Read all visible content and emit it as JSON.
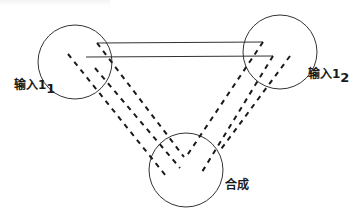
{
  "diagram": {
    "nodes": [
      {
        "id": "input1",
        "label": "输入1",
        "subscript": "1",
        "cx": 75,
        "cy": 62,
        "r": 37
      },
      {
        "id": "input2",
        "label": "输入1",
        "subscript": "2",
        "cx": 280,
        "cy": 52,
        "r": 37
      },
      {
        "id": "synth",
        "label": "合成",
        "subscript": "",
        "cx": 186,
        "cy": 170,
        "r": 37
      }
    ],
    "solid_lines": [
      {
        "x1": 97,
        "y1": 43,
        "x2": 263,
        "y2": 42
      },
      {
        "x1": 86,
        "y1": 57,
        "x2": 273,
        "y2": 56
      }
    ],
    "dashed_lines": [
      {
        "from": "input1",
        "x1": 97,
        "y1": 43,
        "x2": 184,
        "y2": 157
      },
      {
        "from": "input1",
        "x1": 68,
        "y1": 54,
        "x2": 166,
        "y2": 176
      },
      {
        "from": "input1",
        "x1": 95,
        "y1": 68,
        "x2": 180,
        "y2": 168
      },
      {
        "from": "input2",
        "x1": 263,
        "y1": 42,
        "x2": 186,
        "y2": 157
      },
      {
        "from": "input2",
        "x1": 273,
        "y1": 56,
        "x2": 202,
        "y2": 172
      },
      {
        "from": "input2",
        "x1": 290,
        "y1": 56,
        "x2": 219,
        "y2": 152
      }
    ],
    "stroke_color": "#1a1a1a"
  }
}
